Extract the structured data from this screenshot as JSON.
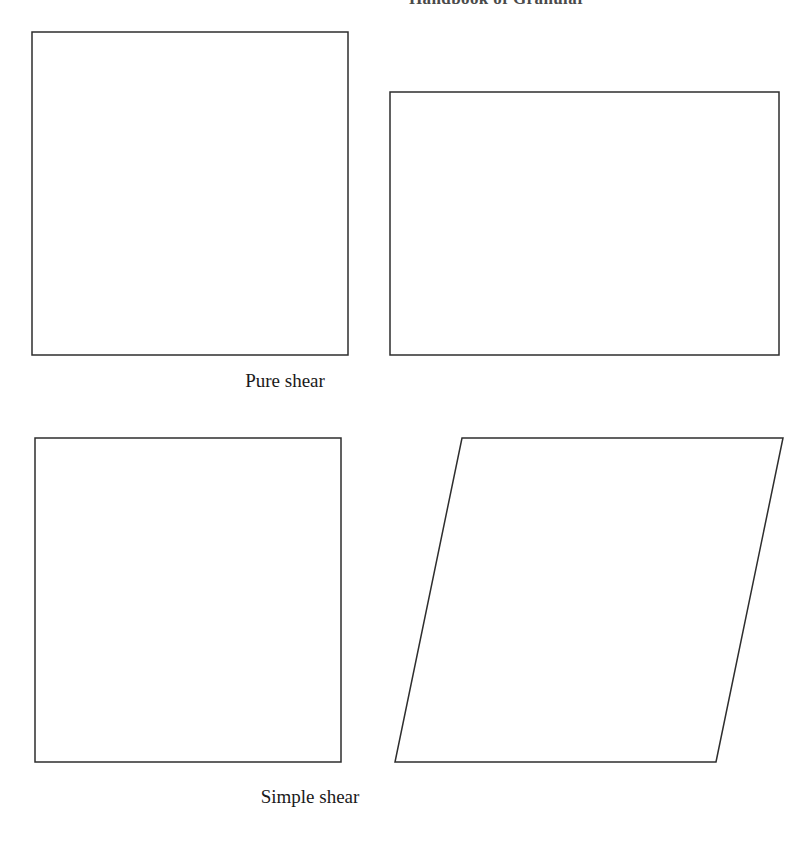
{
  "page": {
    "width": 798,
    "height": 843,
    "background_color": "#ffffff",
    "stroke_color": "#2e2e2e",
    "header_color": "#4a4a4a",
    "caption_color": "#1a1a1a"
  },
  "header": {
    "text": "Handbook of Granular",
    "note": "running head, clipped at top and right page edge"
  },
  "figure": {
    "rows": [
      {
        "id": "pure-shear",
        "caption": "Pure shear",
        "undeformed": {
          "name": "undeformed-square",
          "shape": "rectangle",
          "points": "32,32 348,32 348,355 32,355"
        },
        "deformed": {
          "name": "pure-shear-rectangle",
          "shape": "rectangle",
          "points": "390,92 779,92 779,355 390,355"
        }
      },
      {
        "id": "simple-shear",
        "caption": "Simple shear",
        "undeformed": {
          "name": "undeformed-square",
          "shape": "rectangle",
          "points": "35,438 341,438 341,762 35,762"
        },
        "deformed": {
          "name": "simple-shear-parallelogram",
          "shape": "parallelogram",
          "points": "462,438 783,438 716,762 395,762"
        }
      }
    ]
  }
}
